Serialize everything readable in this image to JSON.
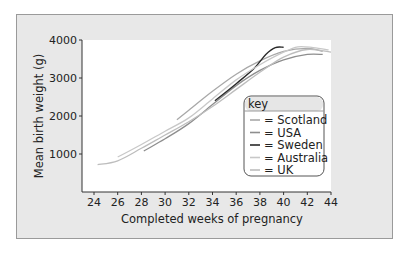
{
  "chart_data": {
    "type": "line",
    "title": "",
    "xlabel": "Completed weeks of pregnancy",
    "ylabel": "Mean birth weight (g)",
    "xlim": [
      23,
      44
    ],
    "ylim": [
      0,
      4000
    ],
    "x_ticks": [
      24,
      26,
      28,
      30,
      32,
      34,
      36,
      38,
      40,
      42,
      44
    ],
    "y_ticks": [
      1000,
      2000,
      3000,
      4000
    ],
    "grid": false,
    "legend": {
      "title": "key",
      "position": "lower right inside plot"
    },
    "series": [
      {
        "name": "Scotland",
        "color": "#a8a8a8",
        "x": [
          31,
          32,
          34,
          36,
          38,
          40,
          42,
          43.3
        ],
        "y": [
          1900,
          2150,
          2650,
          3100,
          3450,
          3700,
          3780,
          3700
        ]
      },
      {
        "name": "USA",
        "color": "#8e8e8e",
        "x": [
          28.2,
          30,
          32,
          34,
          36,
          38,
          40,
          42,
          43.3
        ],
        "y": [
          1080,
          1400,
          1800,
          2300,
          2800,
          3200,
          3480,
          3620,
          3620
        ]
      },
      {
        "name": "Sweden",
        "color": "#2a2a2a",
        "x": [
          34.2,
          36,
          37.5,
          38.5,
          39.3,
          40
        ],
        "y": [
          2400,
          2850,
          3250,
          3620,
          3800,
          3810
        ]
      },
      {
        "name": "Australia",
        "color": "#c8c8c8",
        "x": [
          26,
          28,
          30,
          32,
          34,
          36,
          38,
          40,
          41.2,
          42.5,
          43.8
        ],
        "y": [
          920,
          1250,
          1600,
          1950,
          2450,
          2950,
          3350,
          3680,
          3820,
          3800,
          3740
        ]
      },
      {
        "name": "UK",
        "color": "#bdbdbd",
        "x": [
          24.3,
          26,
          28,
          30,
          32,
          34,
          36,
          38,
          40,
          42,
          44
        ],
        "y": [
          720,
          820,
          1150,
          1500,
          1850,
          2250,
          2700,
          3150,
          3550,
          3750,
          3680
        ]
      }
    ]
  },
  "axes": {
    "xlabel": "Completed weeks of pregnancy",
    "ylabel": "Mean birth weight (g)",
    "x_tick_labels": [
      "24",
      "26",
      "28",
      "30",
      "32",
      "34",
      "36",
      "38",
      "40",
      "42",
      "44"
    ],
    "y_tick_labels": [
      "1000",
      "2000",
      "3000",
      "4000"
    ]
  },
  "legend": {
    "title": "key",
    "items": [
      {
        "label": "= Scotland",
        "color": "#a8a8a8"
      },
      {
        "label": "= USA",
        "color": "#8e8e8e"
      },
      {
        "label": "= Sweden",
        "color": "#2a2a2a"
      },
      {
        "label": "= Australia",
        "color": "#c8c8c8"
      },
      {
        "label": "= UK",
        "color": "#bdbdbd"
      }
    ]
  }
}
